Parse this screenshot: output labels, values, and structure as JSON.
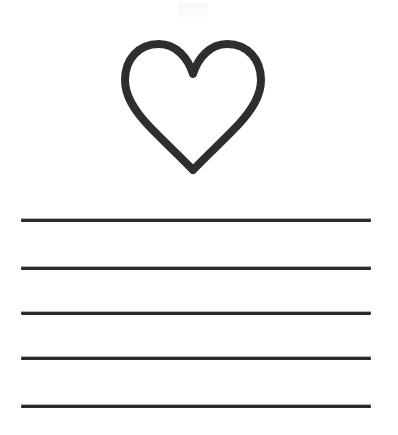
{
  "page": {
    "kind": "worksheet-page",
    "background_color": "#ffffff",
    "width": 398,
    "height": 435
  },
  "illustration": {
    "icon_name": "heart-outline-icon",
    "label": "heart",
    "fill": "none",
    "stroke_color": "#2e2e2e",
    "stroke_width": 8,
    "bounds": {
      "x": 124,
      "y": 35,
      "width": 135,
      "height": 135
    }
  },
  "artifact": {
    "name": "scan-artifact",
    "color": "#f6f6f8"
  },
  "writing_lines": {
    "count": 5,
    "color": "#2a2a2a",
    "thickness": 3,
    "left": 21,
    "right": 371,
    "length": 350,
    "items": [
      {
        "index": 1,
        "y": 219
      },
      {
        "index": 2,
        "y": 267
      },
      {
        "index": 3,
        "y": 312
      },
      {
        "index": 4,
        "y": 357
      },
      {
        "index": 5,
        "y": 405
      }
    ]
  }
}
